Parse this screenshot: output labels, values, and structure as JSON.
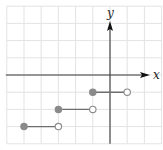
{
  "chart_data": {
    "type": "line",
    "title": "",
    "subtitle": "",
    "xlabel": "x",
    "ylabel": "y",
    "xlim": [
      -6,
      3
    ],
    "ylim": [
      -4,
      4
    ],
    "grid": true,
    "grid_step": 1,
    "legend": null,
    "series": [
      {
        "name": "segment-1",
        "y": -1,
        "x_start": -1,
        "x_end": 1,
        "start_closed": true,
        "end_closed": false
      },
      {
        "name": "segment-2",
        "y": -2,
        "x_start": -3,
        "x_end": -1,
        "start_closed": true,
        "end_closed": false
      },
      {
        "name": "segment-3",
        "y": -3,
        "x_start": -5,
        "x_end": -3,
        "start_closed": true,
        "end_closed": false
      }
    ]
  },
  "labels": {
    "x_axis": "x",
    "y_axis": "y"
  },
  "colors": {
    "grid": "#e3e3e3",
    "axis": "#3a3a3a",
    "segment": "#6f6f6f",
    "filled_dot": "#8a8a8a",
    "open_dot_stroke": "#8a8a8a",
    "open_dot_fill": "#ffffff"
  },
  "layout": {
    "origin_px": [
      110,
      75
    ],
    "unit_px": 17.2
  }
}
